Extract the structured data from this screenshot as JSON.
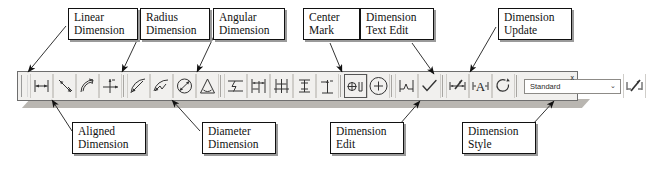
{
  "figure": {
    "kind": "annotated-toolbar-diagram",
    "application": "CAD dimension toolbar",
    "background": "#ffffff",
    "ink_color": "#111111",
    "toolbar_face": "#f1f0ee"
  },
  "toolbar": {
    "name": "Dimension toolbar",
    "grip": "drag-grip",
    "close_label": "x",
    "style_combo": {
      "value": "Standard",
      "chevron": "⌄"
    },
    "buttons": [
      {
        "id": "linear-dimension",
        "icon": "linear-dimension-icon",
        "tooltip": "Linear Dimension"
      },
      {
        "id": "aligned-dimension",
        "icon": "aligned-dimension-icon",
        "tooltip": "Aligned Dimension"
      },
      {
        "id": "arc-length-dimension",
        "icon": "arc-length-dimension-icon",
        "tooltip": "Arc Length Dimension"
      },
      {
        "id": "ordinate-dimension",
        "icon": "ordinate-dimension-icon",
        "tooltip": "Ordinate Dimension"
      },
      {
        "id": "radius-dimension",
        "icon": "radius-dimension-icon",
        "tooltip": "Radius Dimension"
      },
      {
        "id": "jogged-dimension",
        "icon": "jogged-dimension-icon",
        "tooltip": "Jogged Dimension"
      },
      {
        "id": "diameter-dimension",
        "icon": "diameter-dimension-icon",
        "tooltip": "Diameter Dimension"
      },
      {
        "id": "angular-dimension",
        "icon": "angular-dimension-icon",
        "tooltip": "Angular Dimension"
      },
      {
        "id": "quick-dimension",
        "icon": "quick-dimension-icon",
        "tooltip": "Quick Dimension"
      },
      {
        "id": "baseline-dimension",
        "icon": "baseline-dimension-icon",
        "tooltip": "Baseline Dimension"
      },
      {
        "id": "continue-dimension",
        "icon": "continue-dimension-icon",
        "tooltip": "Continue Dimension"
      },
      {
        "id": "quick-leader",
        "icon": "quick-leader-icon",
        "tooltip": "Quick Leader"
      },
      {
        "id": "tolerance",
        "icon": "tolerance-icon",
        "tooltip": "Tolerance"
      },
      {
        "id": "center-mark",
        "icon": "center-mark-icon",
        "tooltip": "Center Mark"
      },
      {
        "id": "inspection",
        "icon": "inspection-icon",
        "tooltip": "Inspection"
      },
      {
        "id": "jogged-linear",
        "icon": "jogged-linear-icon",
        "tooltip": "Jogged Linear"
      },
      {
        "id": "dimension-edit",
        "icon": "dimension-edit-icon",
        "tooltip": "Dimension Edit"
      },
      {
        "id": "dimension-text-edit",
        "icon": "dimension-text-edit-icon",
        "tooltip": "Dimension Text Edit"
      },
      {
        "id": "dimension-update",
        "icon": "dimension-update-icon",
        "tooltip": "Dimension Update"
      },
      {
        "id": "dimension-style",
        "icon": "dimension-style-icon",
        "tooltip": "Dimension Style"
      }
    ]
  },
  "callouts": {
    "top": [
      {
        "id": "linear-dimension",
        "line1": "Linear",
        "line2": "Dimension"
      },
      {
        "id": "radius-dimension",
        "line1": "Radius",
        "line2": "Dimension"
      },
      {
        "id": "angular-dimension",
        "line1": "Angular",
        "line2": "Dimension"
      },
      {
        "id": "center-mark",
        "line1": "Center",
        "line2": "Mark"
      },
      {
        "id": "dimension-text-edit",
        "line1": "Dimension",
        "line2": "Text Edit"
      },
      {
        "id": "dimension-update",
        "line1": "Dimension",
        "line2": "Update"
      }
    ],
    "bottom": [
      {
        "id": "aligned-dimension",
        "line1": "Aligned",
        "line2": "Dimension"
      },
      {
        "id": "diameter-dimension",
        "line1": "Diameter",
        "line2": "Dimension"
      },
      {
        "id": "dimension-edit",
        "line1": "Dimension",
        "line2": "Edit"
      },
      {
        "id": "dimension-style",
        "line1": "Dimension",
        "line2": "Style"
      }
    ]
  }
}
